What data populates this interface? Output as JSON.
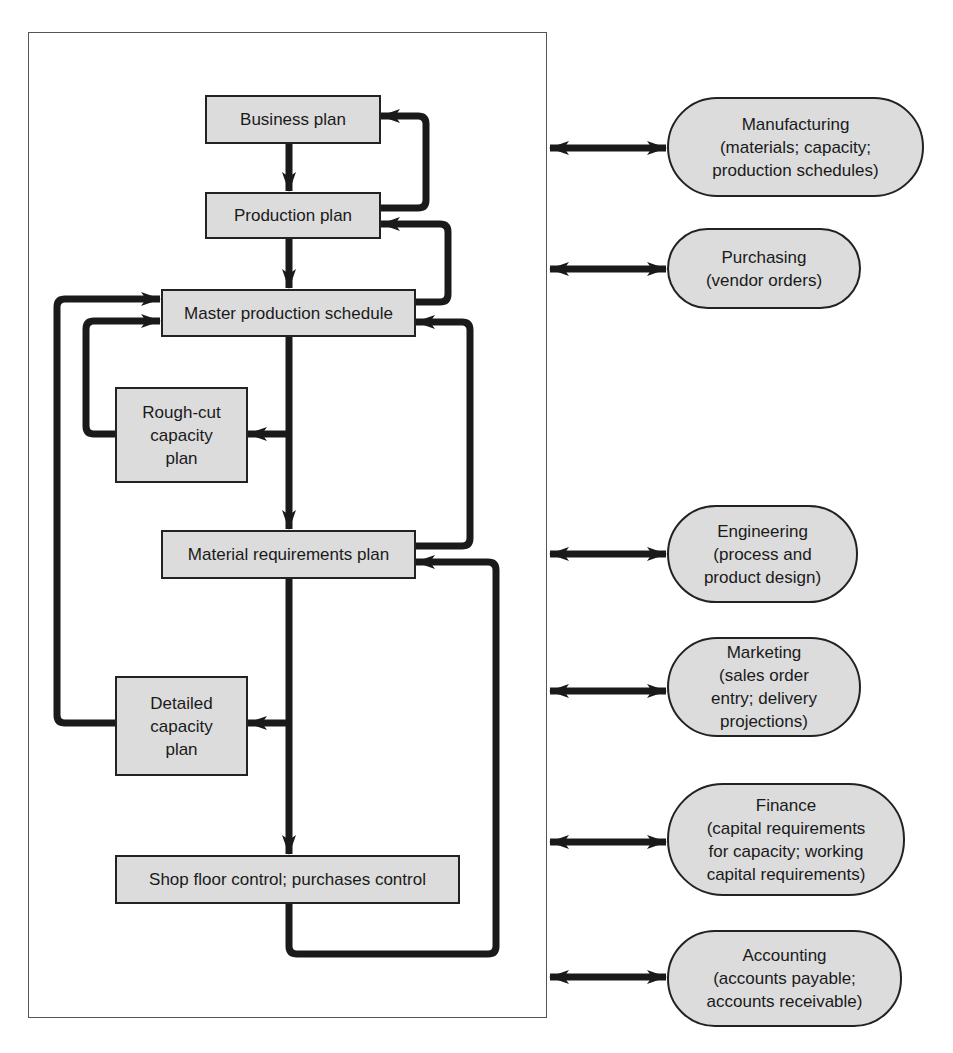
{
  "diagram": {
    "type": "flowchart",
    "colors": {
      "box_fill": "#dcdcdc",
      "stroke": "#222222",
      "frame": "#555555",
      "background": "#ffffff"
    },
    "nodes": [
      {
        "id": "business_plan",
        "label": "Business plan"
      },
      {
        "id": "production_plan",
        "label": "Production plan"
      },
      {
        "id": "mps",
        "label": "Master production schedule"
      },
      {
        "id": "rough_cut",
        "label": "Rough-cut\ncapacity\nplan"
      },
      {
        "id": "mrp",
        "label": "Material requirements plan"
      },
      {
        "id": "detailed_capacity",
        "label": "Detailed\ncapacity\nplan"
      },
      {
        "id": "shop_floor",
        "label": "Shop floor control; purchases control"
      }
    ],
    "functions": [
      {
        "id": "manufacturing",
        "title": "Manufacturing",
        "lines": [
          "(materials; capacity;",
          "production schedules)"
        ]
      },
      {
        "id": "purchasing",
        "title": "Purchasing",
        "lines": [
          "(vendor orders)"
        ]
      },
      {
        "id": "engineering",
        "title": "Engineering",
        "lines": [
          "(process and",
          "product design)"
        ]
      },
      {
        "id": "marketing",
        "title": "Marketing",
        "lines": [
          "(sales order",
          "entry; delivery",
          "projections)"
        ]
      },
      {
        "id": "finance",
        "title": "Finance",
        "lines": [
          "(capital requirements",
          "for capacity; working",
          "capital requirements)"
        ]
      },
      {
        "id": "accounting",
        "title": "Accounting",
        "lines": [
          "(accounts payable;",
          "accounts receivable)"
        ]
      }
    ],
    "edges": [
      {
        "from": "business_plan",
        "to": "production_plan"
      },
      {
        "from": "production_plan",
        "to": "business_plan",
        "kind": "feedback"
      },
      {
        "from": "production_plan",
        "to": "mps"
      },
      {
        "from": "mps",
        "to": "production_plan",
        "kind": "feedback"
      },
      {
        "from": "mps",
        "to": "rough_cut"
      },
      {
        "from": "rough_cut",
        "to": "mps",
        "kind": "feedback"
      },
      {
        "from": "mps",
        "to": "mrp"
      },
      {
        "from": "mrp",
        "to": "mps",
        "kind": "feedback"
      },
      {
        "from": "mrp",
        "to": "detailed_capacity"
      },
      {
        "from": "detailed_capacity",
        "to": "mps",
        "kind": "feedback"
      },
      {
        "from": "mrp",
        "to": "shop_floor"
      },
      {
        "from": "shop_floor",
        "to": "mrp",
        "kind": "feedback"
      },
      {
        "from": "system",
        "to": "manufacturing",
        "kind": "bidirectional"
      },
      {
        "from": "system",
        "to": "purchasing",
        "kind": "bidirectional"
      },
      {
        "from": "system",
        "to": "engineering",
        "kind": "bidirectional"
      },
      {
        "from": "system",
        "to": "marketing",
        "kind": "bidirectional"
      },
      {
        "from": "system",
        "to": "finance",
        "kind": "bidirectional"
      },
      {
        "from": "system",
        "to": "accounting",
        "kind": "bidirectional"
      }
    ]
  }
}
